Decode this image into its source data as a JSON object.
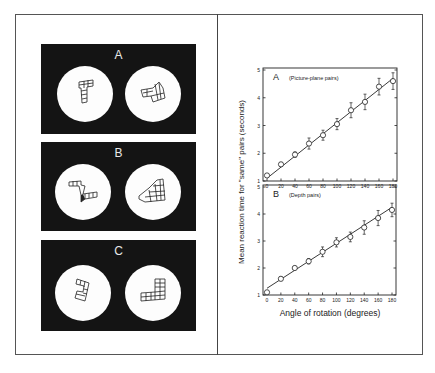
{
  "figure": {
    "stimuli_panels": [
      {
        "label": "A",
        "description": "Picture-plane rotation pair"
      },
      {
        "label": "B",
        "description": "Depth rotation pair"
      },
      {
        "label": "C",
        "description": "Mirror-image (different) pair"
      }
    ],
    "colors": {
      "panel_bg": "#141414",
      "disc": "#fdfdfd",
      "ink": "#222222"
    }
  },
  "chart_data": [
    {
      "type": "line",
      "panel_label": "A",
      "title": "(Picture-plane pairs)",
      "xlabel": "Angle of rotation (degrees)",
      "ylabel": "Mean reaction time for \"same\" pairs (seconds)",
      "x": [
        0,
        20,
        40,
        60,
        80,
        100,
        120,
        140,
        160,
        180
      ],
      "values": [
        1.2,
        1.6,
        1.95,
        2.35,
        2.65,
        3.05,
        3.55,
        3.85,
        4.4,
        4.6
      ],
      "error": [
        0.05,
        0.07,
        0.1,
        0.2,
        0.18,
        0.2,
        0.27,
        0.28,
        0.3,
        0.3
      ],
      "fit_line": {
        "x": [
          0,
          180
        ],
        "y": [
          1.1,
          4.7
        ]
      },
      "xticks": [
        "0",
        "20",
        "40",
        "60",
        "80",
        "100",
        "120",
        "140",
        "160",
        "180"
      ],
      "yticks": [
        "1",
        "2",
        "3",
        "4",
        "5"
      ],
      "xlim": [
        0,
        180
      ],
      "ylim": [
        1,
        5
      ],
      "marker": "open-circle",
      "grid": false
    },
    {
      "type": "line",
      "panel_label": "B",
      "title": "(Depth pairs)",
      "xlabel": "Angle of rotation (degrees)",
      "ylabel": "Mean reaction time for \"same\" pairs (seconds)",
      "x": [
        0,
        20,
        40,
        60,
        80,
        100,
        120,
        140,
        160,
        180
      ],
      "values": [
        1.1,
        1.6,
        2.0,
        2.25,
        2.6,
        2.95,
        3.15,
        3.5,
        3.85,
        4.15
      ],
      "error": [
        0.05,
        0.07,
        0.07,
        0.1,
        0.18,
        0.17,
        0.18,
        0.25,
        0.28,
        0.25
      ],
      "fit_line": {
        "x": [
          0,
          180
        ],
        "y": [
          1.25,
          4.25
        ]
      },
      "xticks": [
        "0",
        "20",
        "40",
        "60",
        "80",
        "100",
        "120",
        "140",
        "160",
        "180"
      ],
      "yticks": [
        "1",
        "2",
        "3",
        "4",
        "5"
      ],
      "xlim": [
        0,
        180
      ],
      "ylim": [
        1,
        5
      ],
      "marker": "open-circle",
      "grid": false
    }
  ]
}
